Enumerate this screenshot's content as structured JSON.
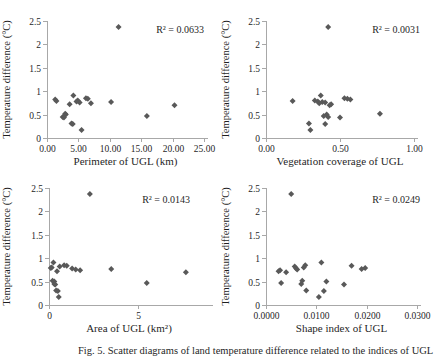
{
  "figure": {
    "caption": "Fig. 5. Scatter diagrams of land temperature difference related to the indices of UGL",
    "marker_color": "#595959",
    "axis_color": "#a8a8a8",
    "text_color": "#1f1f1f"
  },
  "chart_data": [
    {
      "type": "scatter",
      "xlabel": "Perimeter of UGL (km)",
      "ylabel": "Temperature difference (°C)",
      "annotation": "R² = 0.0633",
      "xlim": [
        0,
        25
      ],
      "ylim": [
        0,
        2.5
      ],
      "xticks": {
        "values": [
          0,
          5,
          10,
          15,
          20,
          25
        ],
        "labels": [
          "0.00",
          "5.00",
          "10.00",
          "15.00",
          "20.00",
          "25.00"
        ]
      },
      "yticks": {
        "values": [
          0,
          0.5,
          1,
          1.5,
          2,
          2.5
        ],
        "labels": [
          "0",
          "0.5",
          "1",
          "1.5",
          "2",
          "2.5"
        ]
      },
      "x": [
        11.4,
        4.2,
        6.2,
        6.5,
        1.3,
        4.9,
        1.5,
        4.7,
        10.2,
        5.2,
        7.0,
        3.6,
        20.3,
        2.9,
        3.0,
        15.9,
        2.5,
        2.7,
        3.9,
        4.1,
        5.5
      ],
      "y": [
        2.37,
        0.91,
        0.85,
        0.84,
        0.82,
        0.8,
        0.79,
        0.78,
        0.77,
        0.76,
        0.74,
        0.72,
        0.7,
        0.52,
        0.5,
        0.47,
        0.45,
        0.44,
        0.31,
        0.3,
        0.17
      ]
    },
    {
      "type": "scatter",
      "xlabel": "Vegetation coverage of UGL",
      "ylabel": "Temperature difference (°C)",
      "annotation": "R² = 0.0031",
      "xlim": [
        0,
        1
      ],
      "ylim": [
        0,
        2.5
      ],
      "xticks": {
        "values": [
          0,
          0.5,
          1
        ],
        "labels": [
          "0.00",
          "0.50",
          "1.00"
        ]
      },
      "yticks": {
        "values": [
          0,
          0.5,
          1,
          1.5,
          2,
          2.5
        ],
        "labels": [
          "0",
          "0.5",
          "1",
          "1.5",
          "2",
          "2.5"
        ]
      },
      "x": [
        0.42,
        0.37,
        0.53,
        0.55,
        0.57,
        0.33,
        0.18,
        0.35,
        0.38,
        0.4,
        0.36,
        0.44,
        0.43,
        0.77,
        0.41,
        0.39,
        0.42,
        0.5,
        0.29,
        0.4,
        0.3
      ],
      "y": [
        2.37,
        0.91,
        0.85,
        0.84,
        0.82,
        0.8,
        0.79,
        0.78,
        0.77,
        0.76,
        0.74,
        0.72,
        0.7,
        0.52,
        0.5,
        0.47,
        0.45,
        0.44,
        0.31,
        0.3,
        0.17
      ]
    },
    {
      "type": "scatter",
      "xlabel": "Area of UGL (km²)",
      "ylabel": "Temperature difference (°C)",
      "annotation": "R² = 0.0143",
      "xlim": [
        0,
        9
      ],
      "ylim": [
        0,
        2.5
      ],
      "xticks": {
        "values": [
          0,
          5
        ],
        "labels": [
          "0",
          "5"
        ]
      },
      "yticks": {
        "values": [
          0,
          0.5,
          1,
          1.5,
          2,
          2.5
        ],
        "labels": [
          "0",
          "0.5",
          "1",
          "1.5",
          "2",
          "2.5"
        ]
      },
      "x": [
        2.3,
        0.25,
        0.85,
        1.0,
        0.6,
        0.15,
        0.1,
        1.3,
        3.5,
        1.5,
        1.75,
        0.45,
        7.7,
        0.2,
        0.3,
        5.5,
        0.3,
        0.35,
        0.4,
        0.5,
        0.55
      ],
      "y": [
        2.37,
        0.91,
        0.85,
        0.84,
        0.82,
        0.8,
        0.79,
        0.78,
        0.77,
        0.76,
        0.74,
        0.72,
        0.7,
        0.52,
        0.5,
        0.47,
        0.45,
        0.44,
        0.31,
        0.3,
        0.17
      ]
    },
    {
      "type": "scatter",
      "xlabel": "Shape index of UGL",
      "ylabel": "Temperature difference (°C)",
      "annotation": "R² = 0.0249",
      "xlim": [
        0,
        0.03
      ],
      "ylim": [
        0,
        2.5
      ],
      "xticks": {
        "values": [
          0,
          0.01,
          0.02,
          0.03
        ],
        "labels": [
          "0.0000",
          "0.0100",
          "0.0200",
          "0.0300"
        ]
      },
      "yticks": {
        "values": [
          0,
          0.5,
          1,
          1.5,
          2,
          2.5
        ],
        "labels": [
          "0",
          "0.5",
          "1",
          "1.5",
          "2",
          "2.5"
        ]
      },
      "x": [
        0.005,
        0.011,
        0.0078,
        0.017,
        0.0057,
        0.0075,
        0.0197,
        0.006,
        0.019,
        0.0062,
        0.0028,
        0.0025,
        0.004,
        0.0072,
        0.012,
        0.003,
        0.007,
        0.0155,
        0.008,
        0.0115,
        0.0105
      ],
      "y": [
        2.37,
        0.91,
        0.85,
        0.84,
        0.82,
        0.8,
        0.79,
        0.78,
        0.77,
        0.76,
        0.74,
        0.72,
        0.7,
        0.52,
        0.5,
        0.47,
        0.45,
        0.44,
        0.31,
        0.3,
        0.17
      ]
    }
  ]
}
